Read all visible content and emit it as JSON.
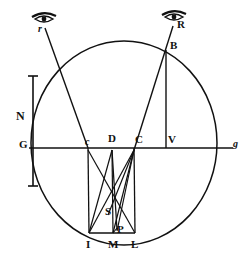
{
  "figure": {
    "stroke_color": "#111111",
    "background_color": "#ffffff",
    "labels": {
      "eye_left": "r",
      "eye_right": "R",
      "point_B": "B",
      "point_V": "V",
      "point_C": "C",
      "point_D": "D",
      "point_c": "c",
      "point_G": "G",
      "point_g": "g",
      "point_N": "N",
      "point_S": "S",
      "point_I": "I",
      "point_M": "M",
      "point_P": "P",
      "point_L": "L"
    },
    "icons": {
      "eye_left": "eye-icon",
      "eye_right": "eye-icon"
    },
    "geometry": {
      "circle": {
        "cx": 124,
        "cy": 143,
        "rx": 93,
        "ry": 102
      },
      "diameter_line": {
        "x1": 29,
        "y1": 148,
        "x2": 233,
        "y2": 148
      },
      "scale_bar": {
        "x": 33,
        "y1": 76,
        "y2": 186
      },
      "points": {
        "eye_left": {
          "x": 44,
          "y": 22
        },
        "eye_right": {
          "x": 174,
          "y": 20
        },
        "B": {
          "x": 166,
          "y": 49
        },
        "V": {
          "x": 166,
          "y": 148
        },
        "C": {
          "x": 134,
          "y": 148
        },
        "D": {
          "x": 112,
          "y": 148
        },
        "c": {
          "x": 88,
          "y": 148
        },
        "G": {
          "x": 29,
          "y": 148
        },
        "g": {
          "x": 233,
          "y": 148
        },
        "S": {
          "x": 110,
          "y": 208
        },
        "I": {
          "x": 89,
          "y": 238
        },
        "M": {
          "x": 113,
          "y": 238
        },
        "P": {
          "x": 117,
          "y": 232
        },
        "L": {
          "x": 134,
          "y": 238
        }
      }
    }
  }
}
